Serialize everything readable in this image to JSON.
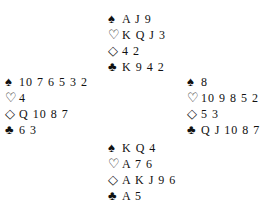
{
  "deal": {
    "north": {
      "spades": "A J 9",
      "hearts": "K Q J 3",
      "diamonds": "4 2",
      "clubs": "K 9 4 2"
    },
    "west": {
      "spades": "10 7 6 5 3 2",
      "hearts": "4",
      "diamonds": "Q 10 8 7",
      "clubs": "6 3"
    },
    "east": {
      "spades": "8",
      "hearts": "10 9 8 5 2",
      "diamonds": "5 3",
      "clubs": "Q J 10 8 7"
    },
    "south": {
      "spades": "K Q 4",
      "hearts": "A 7 6",
      "diamonds": "A K J 9 6",
      "clubs": "A 5"
    }
  },
  "symbols": {
    "spades": "♠",
    "hearts": "♡",
    "diamonds": "◇",
    "clubs": "♣"
  }
}
